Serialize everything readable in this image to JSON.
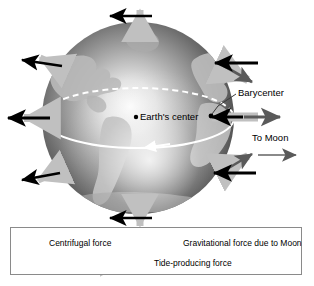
{
  "diagram": {
    "labels": {
      "barycenter": "Barycenter",
      "earth_center": "Earth's center",
      "to_moon": "To Moon"
    },
    "legend": {
      "items": [
        {
          "id": "centrifugal",
          "label": "Centrifugal force",
          "icon": "left-arrow-icon",
          "color": "#000000"
        },
        {
          "id": "gravitational",
          "label": "Gravitational force due to Moon",
          "icon": "right-arrow-icon",
          "color": "#5a5a5a"
        },
        {
          "id": "tide",
          "label": "Tide-producing force",
          "icon": "thick-bar-arrow-icon",
          "color": "#c0c0c0"
        }
      ]
    },
    "colors": {
      "centrifugal": "#000000",
      "gravitational": "#5a5a5a",
      "tide": "#c0c0c0",
      "globe_ocean_dark": "#4a4a4a",
      "globe_highlight": "#f2f2f2",
      "globe_land": "#b5b5b5",
      "orbit_line": "#ffffff",
      "legend_border": "#8a8a8a",
      "background": "#ffffff"
    },
    "globe": {
      "center_x": 138,
      "center_y": 118,
      "radius": 96,
      "earth_center_dot": {
        "x": 144,
        "y": 116
      },
      "barycenter_dot": {
        "x": 210,
        "y": 117
      }
    },
    "force_arrows": [
      {
        "id": "top",
        "angle_deg": 270,
        "centrifugal": true,
        "gravitational": false,
        "tide": true
      },
      {
        "id": "top-left",
        "angle_deg": 215,
        "centrifugal": true,
        "gravitational": false,
        "tide": true
      },
      {
        "id": "top-right",
        "angle_deg": 325,
        "centrifugal": true,
        "gravitational": true,
        "tide": true
      },
      {
        "id": "left",
        "angle_deg": 180,
        "centrifugal": true,
        "gravitational": false,
        "tide": true
      },
      {
        "id": "right-equator",
        "angle_deg": 0,
        "centrifugal": true,
        "gravitational": true,
        "tide": true
      },
      {
        "id": "bottom-left",
        "angle_deg": 145,
        "centrifugal": true,
        "gravitational": false,
        "tide": true
      },
      {
        "id": "bottom-right",
        "angle_deg": 35,
        "centrifugal": true,
        "gravitational": true,
        "tide": true
      },
      {
        "id": "bottom",
        "angle_deg": 90,
        "centrifugal": true,
        "gravitational": false,
        "tide": true
      }
    ]
  }
}
